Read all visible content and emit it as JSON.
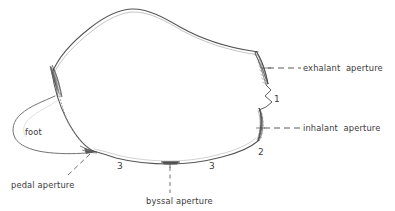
{
  "figure": {
    "kind": "bivalve-mollusc-shell-anatomy-line-drawing",
    "background_color": "#ffffff",
    "ink_color": "#4a4a4a",
    "label_color": "#3a3a3a"
  },
  "labels": {
    "exhalant_aperture": "exhalant  aperture",
    "inhalant_aperture": "inhalant  aperture",
    "pedal_aperture": "pedal aperture",
    "byssal_aperture": "byssal aperture",
    "foot": "foot"
  },
  "numbers": {
    "one": "1",
    "two": "2",
    "three_left": "3",
    "three_right": "3"
  },
  "leader_lines": {
    "exhalant": {
      "style": "dashed",
      "from_x": 268,
      "from_y": 68,
      "to_x": 300,
      "to_y": 68
    },
    "inhalant": {
      "style": "dashed",
      "from_x": 262,
      "from_y": 128,
      "to_x": 300,
      "to_y": 128
    },
    "pedal": {
      "style": "dashed",
      "from_x": 90,
      "from_y": 154,
      "to_x": 68,
      "to_y": 176
    },
    "byssal": {
      "style": "dashed",
      "from_x": 170,
      "from_y": 165,
      "to_x": 170,
      "to_y": 192
    }
  },
  "features": {
    "exhalant_patch": "hatched narrow lens on posterior dorsal margin",
    "inhalant_patch": "hatched narrow lens on posterior ventral margin",
    "umbo_patch": "dark shaded convergence at anterior dorsal point",
    "pedal_patch": "dark shaded point at anterior ventral margin",
    "byssal_notch": "small dark notch at mid ventral margin",
    "foot_outline": "lobe projecting anteriorly from shell",
    "foot_dotted_trace": "dotted curve inside shell from umbo to pedal point"
  }
}
